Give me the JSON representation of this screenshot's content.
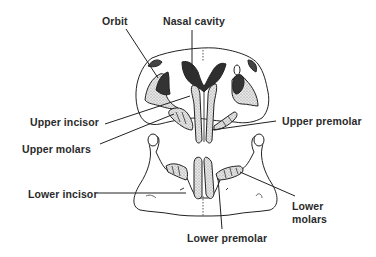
{
  "diagram": {
    "colors": {
      "line": "#222222",
      "dark_fill": "#333333",
      "stipple_fill": "#d9d9d9",
      "background": "#ffffff"
    },
    "labels": {
      "orbit": "Orbit",
      "nasal_cavity": "Nasal cavity",
      "upper_incisor": "Upper incisor",
      "upper_molars": "Upper molars",
      "upper_premolar": "Upper premolar",
      "lower_incisor": "Lower incisor",
      "lower_molars": "Lower\nmolars",
      "lower_premolar": "Lower premolar"
    }
  }
}
